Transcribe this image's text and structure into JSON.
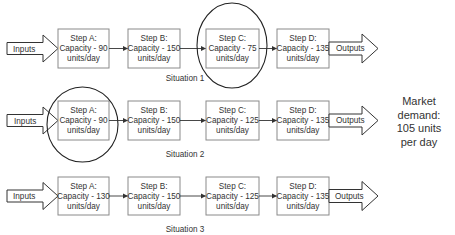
{
  "market_demand": {
    "line1": "Market",
    "line2": "demand:",
    "line3": "105 units",
    "line4": "per day"
  },
  "colors": {
    "box_border": "#8a8a8a",
    "text": "#333333",
    "ellipse": "#222222"
  },
  "situations": [
    {
      "label": "Situation 1",
      "input_label": "Inputs",
      "output_label": "Outputs",
      "bottleneck": "Step C",
      "steps": [
        {
          "name": "Step A:",
          "capacity": "Capacity - 90",
          "unit": "units/day"
        },
        {
          "name": "Step B:",
          "capacity": "Capacity - 150",
          "unit": "units/day"
        },
        {
          "name": "Step C:",
          "capacity": "Capacity - 75",
          "unit": "units/day"
        },
        {
          "name": "Step D:",
          "capacity": "Capacity - 135",
          "unit": "units/day"
        }
      ]
    },
    {
      "label": "Situation 2",
      "input_label": "Inputs",
      "output_label": "Outputs",
      "bottleneck": "Step A",
      "steps": [
        {
          "name": "Step A:",
          "capacity": "Capacity - 90",
          "unit": "units/day"
        },
        {
          "name": "Step B:",
          "capacity": "Capacity - 150",
          "unit": "units/day"
        },
        {
          "name": "Step C:",
          "capacity": "Capacity - 125",
          "unit": "units/day"
        },
        {
          "name": "Step D:",
          "capacity": "Capacity - 135",
          "unit": "units/day"
        }
      ]
    },
    {
      "label": "Situation 3",
      "input_label": "Inputs",
      "output_label": "Outputs",
      "bottleneck": "",
      "steps": [
        {
          "name": "Step A:",
          "capacity": "Capacity - 130",
          "unit": "units/day"
        },
        {
          "name": "Step B:",
          "capacity": "Capacity - 150",
          "unit": "units/day"
        },
        {
          "name": "Step C:",
          "capacity": "Capacity - 125",
          "unit": "units/day"
        },
        {
          "name": "Step D:",
          "capacity": "Capacity - 135",
          "unit": "units/day"
        }
      ]
    }
  ]
}
